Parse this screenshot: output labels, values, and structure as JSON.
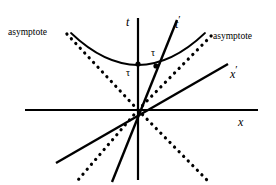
{
  "figure": {
    "kind": "minkowski-spacetime-diagram",
    "background_color": "#ffffff",
    "stroke_color": "#000000",
    "width": 276,
    "height": 185
  },
  "labels": {
    "t_axis": "t",
    "x_axis": "x",
    "t_prime_axis": "t",
    "t_prime_mark": "′",
    "x_prime_axis": "x",
    "x_prime_mark": "′",
    "tau_on_t": "τ",
    "tau_on_t_prime": "τ",
    "asymptote_left": "asymptote",
    "asymptote_right": "asymptote"
  },
  "geometry": {
    "origin": {
      "x": 138,
      "y": 110
    },
    "axes": {
      "x_axis": {
        "x1": 25,
        "y1": 110,
        "x2": 258,
        "y2": 110,
        "width": 2.2
      },
      "t_axis": {
        "x1": 138,
        "y1": 18,
        "x2": 138,
        "y2": 180,
        "width": 2.2
      }
    },
    "primed_axes": {
      "t_prime": {
        "x1": 112,
        "y1": 182,
        "x2": 177,
        "y2": 20,
        "width": 2.4
      },
      "x_prime": {
        "x1": 56,
        "y1": 163,
        "x2": 228,
        "y2": 64,
        "width": 2.4
      }
    },
    "asymptotes": {
      "dot_radius": 1.6,
      "dot_spacing": 6.4,
      "upper_left": {
        "x1": 138,
        "y1": 110,
        "x2": 66,
        "y2": 33
      },
      "upper_right": {
        "x1": 138,
        "y1": 110,
        "x2": 214,
        "y2": 33
      },
      "lower_left": {
        "x1": 138,
        "y1": 110,
        "x2": 78,
        "y2": 180
      },
      "lower_right": {
        "x1": 138,
        "y1": 110,
        "x2": 207,
        "y2": 180
      }
    },
    "hyperbola": {
      "vertex": {
        "x": 138,
        "y": 64
      },
      "left_end": {
        "x": 71,
        "y": 33
      },
      "right_end": {
        "x": 205,
        "y": 33
      },
      "width": 1.8
    },
    "markers": [
      {
        "name": "tau-point-on-t-axis",
        "x": 138,
        "y": 64,
        "r": 2.6
      },
      {
        "name": "tau-point-on-t-prime-axis",
        "x": 156,
        "y": 66,
        "r": 2.6
      }
    ]
  },
  "label_positions": {
    "t_axis": {
      "left": 126,
      "top": 16
    },
    "t_prime_axis": {
      "left": 175,
      "top": 14
    },
    "x_axis": {
      "left": 238,
      "top": 116
    },
    "x_prime_axis": {
      "left": 230,
      "top": 64
    },
    "tau_on_t": {
      "left": 126,
      "top": 68
    },
    "tau_on_t_prime": {
      "left": 151,
      "top": 48
    },
    "asymptote_left": {
      "left": 8,
      "top": 28
    },
    "asymptote_right": {
      "left": 213,
      "top": 32
    }
  }
}
